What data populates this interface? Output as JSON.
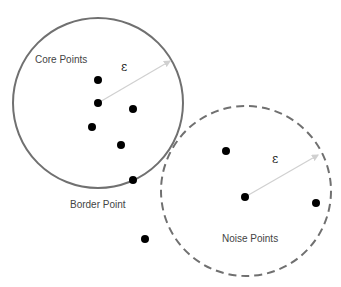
{
  "diagram": {
    "labels": {
      "core": "Core Points",
      "border": "Border Point",
      "noise": "Noise Points",
      "epsilon_1": "ε",
      "epsilon_2": "ε"
    },
    "colors": {
      "circle": "#707070",
      "point": "#000000",
      "radius_arrow": "#d0d0d0",
      "text": "#444444"
    },
    "circles": [
      {
        "name": "core-neighborhood",
        "cx": 98,
        "cy": 103,
        "r": 85,
        "style": "solid"
      },
      {
        "name": "noise-neighborhood",
        "cx": 246,
        "cy": 191,
        "r": 85,
        "style": "dashed"
      }
    ],
    "points": [
      {
        "x": 98,
        "y": 80
      },
      {
        "x": 98,
        "y": 103
      },
      {
        "x": 133,
        "y": 109
      },
      {
        "x": 92,
        "y": 127
      },
      {
        "x": 121,
        "y": 145
      },
      {
        "x": 133,
        "y": 180
      },
      {
        "x": 226,
        "y": 151
      },
      {
        "x": 245,
        "y": 197
      },
      {
        "x": 316,
        "y": 203
      },
      {
        "x": 145,
        "y": 239
      }
    ]
  }
}
